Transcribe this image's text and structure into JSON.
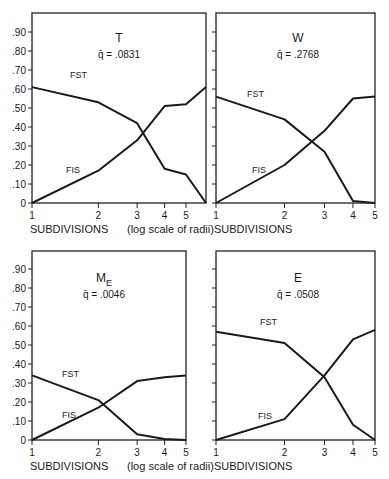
{
  "figure": {
    "y_tick_labels": [
      "0",
      ".10",
      ".20",
      ".30",
      ".40",
      ".50",
      ".60",
      ".70",
      ".80",
      ".90"
    ],
    "x_axis_title": "SUBDIVISIONS",
    "x_axis_note": "(log scale of radii)"
  },
  "chart_data": [
    {
      "type": "line",
      "title": "T",
      "subtitle": "q̄ = .0831",
      "xlabel": "SUBDIVISIONS (log scale of radii)",
      "ylabel": "",
      "x_scale": "log",
      "x_tick_labels": [
        "1",
        "2",
        "3",
        "4",
        "5"
      ],
      "x": [
        1,
        2,
        3,
        4,
        5,
        6
      ],
      "series": [
        {
          "name": "FST",
          "values": [
            0.61,
            0.53,
            0.42,
            0.18,
            0.15,
            0.0
          ]
        },
        {
          "name": "FIS",
          "values": [
            0.0,
            0.17,
            0.33,
            0.51,
            0.52,
            0.61
          ]
        }
      ],
      "ylim": [
        0,
        1.0
      ],
      "grid": false
    },
    {
      "type": "line",
      "title": "W",
      "subtitle": "q̄ = .2768",
      "xlabel": "SUBDIVISIONS",
      "ylabel": "",
      "x_scale": "log",
      "x_tick_labels": [
        "1",
        "2",
        "3",
        "4",
        "5"
      ],
      "x": [
        1,
        2,
        3,
        4,
        5
      ],
      "series": [
        {
          "name": "FST",
          "values": [
            0.56,
            0.44,
            0.27,
            0.01,
            0.0
          ]
        },
        {
          "name": "FIS",
          "values": [
            0.0,
            0.2,
            0.38,
            0.55,
            0.56
          ]
        }
      ],
      "ylim": [
        0,
        1.0
      ],
      "grid": false
    },
    {
      "type": "line",
      "title": "ME",
      "subtitle": "q̄ = .0046",
      "xlabel": "SUBDIVISIONS (log scale of radii)",
      "ylabel": "",
      "x_scale": "log",
      "x_tick_labels": [
        "1",
        "2",
        "3",
        "4",
        "5"
      ],
      "x": [
        1,
        2,
        3,
        4,
        5
      ],
      "series": [
        {
          "name": "FST",
          "values": [
            0.34,
            0.21,
            0.03,
            0.005,
            0.0
          ]
        },
        {
          "name": "FIS",
          "values": [
            0.0,
            0.17,
            0.31,
            0.33,
            0.34
          ]
        }
      ],
      "ylim": [
        0,
        1.0
      ],
      "grid": false
    },
    {
      "type": "line",
      "title": "E",
      "subtitle": "q̄ = .0508",
      "xlabel": "SUBDIVISIONS",
      "ylabel": "",
      "x_scale": "log",
      "x_tick_labels": [
        "1",
        "2",
        "3",
        "4",
        "5"
      ],
      "x": [
        1,
        2,
        3,
        4,
        5
      ],
      "series": [
        {
          "name": "FST",
          "values": [
            0.57,
            0.51,
            0.33,
            0.08,
            0.0
          ]
        },
        {
          "name": "FIS",
          "values": [
            0.0,
            0.11,
            0.34,
            0.53,
            0.58
          ]
        }
      ],
      "ylim": [
        0,
        1.0
      ],
      "grid": false
    }
  ],
  "panels": [
    {
      "title_main": "T",
      "title_sub": "",
      "q_label": "q̄ = .0831",
      "fst_label": "FST",
      "fis_label": "FIS"
    },
    {
      "title_main": "W",
      "title_sub": "",
      "q_label": "q̄ = .2768",
      "fst_label": "FST",
      "fis_label": "FIS"
    },
    {
      "title_main": "M",
      "title_sub": "E",
      "q_label": "q̄ = .0046",
      "fst_label": "FST",
      "fis_label": "FIS"
    },
    {
      "title_main": "E",
      "title_sub": "",
      "q_label": "q̄ = .0508",
      "fst_label": "FST",
      "fis_label": "FIS"
    }
  ]
}
